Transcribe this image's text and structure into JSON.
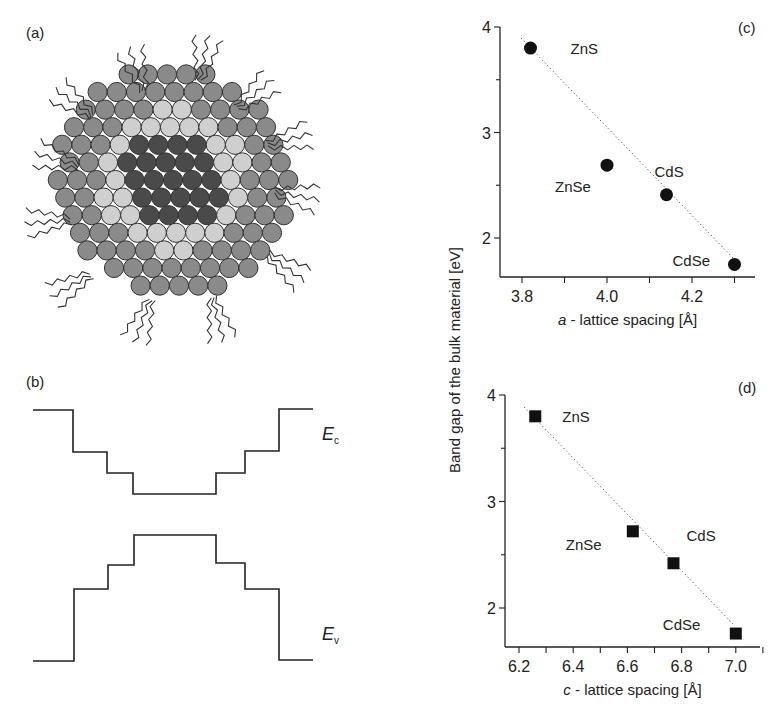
{
  "panels": {
    "a": {
      "label": "(a)",
      "description": "nanocrystal core-shell schematic with ligands"
    },
    "b": {
      "label": "(b)",
      "ec_label": "E",
      "ec_sub": "c",
      "ev_label": "E",
      "ev_sub": "v"
    },
    "c": {
      "label": "(c)"
    },
    "d": {
      "label": "(d)"
    }
  },
  "shared_ylabel": "Band gap of the bulk material [eV]",
  "colors": {
    "outer_shell": "#8a8a8a",
    "inner_shell": "#cfcfcf",
    "core": "#4a4a4a",
    "line": "#222222"
  },
  "chart_data": [
    {
      "type": "scatter",
      "panel": "(c)",
      "title": "",
      "xlabel_italic": "a",
      "xlabel": " - lattice spacing [Å]",
      "ylabel": "Band gap of the bulk material [eV]",
      "xticks": [
        "3.8",
        "4.0",
        "4.2"
      ],
      "yticks": [
        "2",
        "3",
        "4"
      ],
      "xlim": [
        3.75,
        4.35
      ],
      "ylim": [
        1.6,
        4.0
      ],
      "marker": "circle",
      "trendline": "dotted linear fit",
      "points": [
        {
          "name": "ZnS",
          "x": 3.82,
          "y": 3.8
        },
        {
          "name": "ZnSe",
          "x": 4.0,
          "y": 2.69
        },
        {
          "name": "CdS",
          "x": 4.14,
          "y": 2.41
        },
        {
          "name": "CdSe",
          "x": 4.3,
          "y": 1.75
        }
      ]
    },
    {
      "type": "scatter",
      "panel": "(d)",
      "title": "",
      "xlabel_italic": "c",
      "xlabel": " - lattice spacing [Å]",
      "ylabel": "Band gap of the bulk material [eV]",
      "xticks": [
        "6.2",
        "6.4",
        "6.6",
        "6.8",
        "7.0"
      ],
      "yticks": [
        "2",
        "3",
        "4"
      ],
      "xlim": [
        6.15,
        7.1
      ],
      "ylim": [
        1.6,
        4.0
      ],
      "marker": "square",
      "trendline": "dotted linear fit",
      "points": [
        {
          "name": "ZnS",
          "x": 6.26,
          "y": 3.8
        },
        {
          "name": "ZnSe",
          "x": 6.62,
          "y": 2.72
        },
        {
          "name": "CdS",
          "x": 6.77,
          "y": 2.42
        },
        {
          "name": "CdSe",
          "x": 7.0,
          "y": 1.76
        }
      ]
    }
  ]
}
